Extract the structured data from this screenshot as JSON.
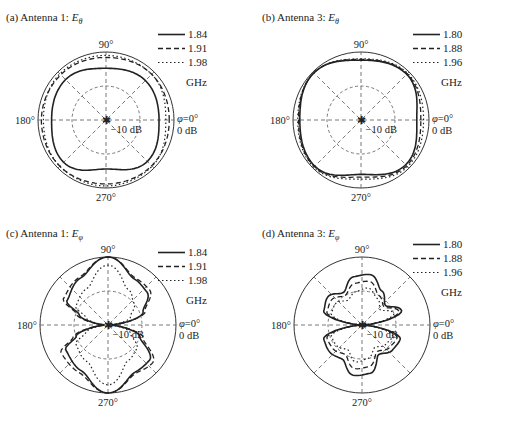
{
  "figure": {
    "panels": [
      {
        "id": "a",
        "title_prefix": "(a) Antenna 1: ",
        "title_field": "E",
        "title_sub": "θ"
      },
      {
        "id": "b",
        "title_prefix": "(b) Antenna 3: ",
        "title_field": "E",
        "title_sub": "θ"
      },
      {
        "id": "c",
        "title_prefix": "(c) Antenna 1: ",
        "title_field": "E",
        "title_sub": "φ"
      },
      {
        "id": "d",
        "title_prefix": "(d) Antenna 3: ",
        "title_field": "E",
        "title_sub": "φ"
      }
    ],
    "angle_labels": {
      "top": "90°",
      "left": "180°",
      "bottom": "270°",
      "right_phi": "φ=0°",
      "right_db": "0 dB"
    },
    "ring_label": "−10 dB",
    "unit": "GHz"
  },
  "chart_data": [
    {
      "type": "polar",
      "title": "(a) Antenna 1: Eθ",
      "radial_ticks": [
        "-10 dB",
        "0 dB"
      ],
      "angle_ticks": [
        "0°",
        "90°",
        "180°",
        "270°"
      ],
      "legend": [
        {
          "label": "1.84",
          "style": "solid"
        },
        {
          "label": "1.91",
          "style": "dashed"
        },
        {
          "label": "1.98",
          "style": "dotted"
        }
      ],
      "legend_unit": "GHz",
      "series": [
        {
          "name": "1.84",
          "angles_deg": [
            0,
            45,
            90,
            135,
            180,
            225,
            270,
            315
          ],
          "radius_norm": [
            0.78,
            0.82,
            0.76,
            0.84,
            0.8,
            0.88,
            0.72,
            0.86
          ]
        },
        {
          "name": "1.91",
          "angles_deg": [
            0,
            45,
            90,
            135,
            180,
            225,
            270,
            315
          ],
          "radius_norm": [
            0.93,
            0.95,
            0.92,
            0.94,
            0.95,
            0.96,
            0.94,
            0.95
          ]
        },
        {
          "name": "1.98",
          "angles_deg": [
            0,
            45,
            90,
            135,
            180,
            225,
            270,
            315
          ],
          "radius_norm": [
            0.88,
            0.95,
            0.95,
            0.96,
            0.92,
            0.96,
            0.97,
            0.96
          ]
        }
      ]
    },
    {
      "type": "polar",
      "title": "(b) Antenna 3: Eθ",
      "radial_ticks": [
        "-10 dB",
        "0 dB"
      ],
      "angle_ticks": [
        "0°",
        "90°",
        "180°",
        "270°"
      ],
      "legend": [
        {
          "label": "1.80",
          "style": "solid"
        },
        {
          "label": "1.88",
          "style": "dashed"
        },
        {
          "label": "1.96",
          "style": "dotted"
        }
      ],
      "legend_unit": "GHz",
      "series": [
        {
          "name": "1.80",
          "angles_deg": [
            0,
            45,
            90,
            135,
            180,
            225,
            270,
            315
          ],
          "radius_norm": [
            0.82,
            0.95,
            0.88,
            0.98,
            0.9,
            0.96,
            0.8,
            0.93
          ]
        },
        {
          "name": "1.88",
          "angles_deg": [
            0,
            45,
            90,
            135,
            180,
            225,
            270,
            315
          ],
          "radius_norm": [
            0.88,
            0.96,
            0.89,
            0.98,
            0.92,
            0.97,
            0.84,
            0.95
          ]
        },
        {
          "name": "1.96",
          "angles_deg": [
            0,
            45,
            90,
            135,
            180,
            225,
            270,
            315
          ],
          "radius_norm": [
            0.92,
            0.97,
            0.9,
            0.98,
            0.93,
            0.98,
            0.87,
            0.97
          ]
        }
      ]
    },
    {
      "type": "polar",
      "title": "(c) Antenna 1: Eφ",
      "radial_ticks": [
        "-10 dB",
        "0 dB"
      ],
      "angle_ticks": [
        "0°",
        "90°",
        "180°",
        "270°"
      ],
      "legend": [
        {
          "label": "1.84",
          "style": "solid"
        },
        {
          "label": "1.91",
          "style": "dashed"
        },
        {
          "label": "1.98",
          "style": "dotted"
        }
      ],
      "legend_unit": "GHz",
      "series": [
        {
          "name": "1.84",
          "angles_deg": [
            0,
            20,
            40,
            60,
            90,
            120,
            150,
            160,
            180,
            200,
            210,
            240,
            270,
            300,
            320,
            340
          ],
          "radius_norm": [
            0.05,
            0.55,
            0.75,
            0.78,
            1.0,
            0.8,
            0.7,
            0.45,
            0.05,
            0.5,
            0.72,
            0.78,
            1.0,
            0.8,
            0.8,
            0.5
          ]
        },
        {
          "name": "1.91",
          "angles_deg": [
            0,
            20,
            40,
            60,
            90,
            120,
            150,
            160,
            180,
            200,
            210,
            240,
            270,
            300,
            320,
            340
          ],
          "radius_norm": [
            0.05,
            0.58,
            0.8,
            0.8,
            1.0,
            0.82,
            0.76,
            0.5,
            0.05,
            0.55,
            0.8,
            0.82,
            1.0,
            0.82,
            0.86,
            0.55
          ]
        },
        {
          "name": "1.98",
          "angles_deg": [
            0,
            20,
            40,
            60,
            90,
            120,
            150,
            160,
            180,
            200,
            210,
            240,
            270,
            300,
            320,
            340
          ],
          "radius_norm": [
            0.05,
            0.35,
            0.5,
            0.6,
            0.88,
            0.62,
            0.55,
            0.35,
            0.05,
            0.35,
            0.55,
            0.62,
            0.88,
            0.6,
            0.55,
            0.35
          ]
        }
      ]
    },
    {
      "type": "polar",
      "title": "(d) Antenna 3: Eφ",
      "radial_ticks": [
        "-10 dB",
        "0 dB"
      ],
      "angle_ticks": [
        "0°",
        "90°",
        "180°",
        "270°"
      ],
      "legend": [
        {
          "label": "1.80",
          "style": "solid"
        },
        {
          "label": "1.88",
          "style": "dashed"
        },
        {
          "label": "1.96",
          "style": "dotted"
        }
      ],
      "legend_unit": "GHz",
      "series": [
        {
          "name": "1.80",
          "angles_deg": [
            0,
            20,
            40,
            60,
            80,
            100,
            120,
            140,
            160,
            180,
            200,
            220,
            240,
            260,
            280,
            300,
            320,
            340
          ],
          "radius_norm": [
            0.02,
            0.62,
            0.45,
            0.58,
            0.75,
            0.72,
            0.55,
            0.65,
            0.6,
            0.02,
            0.6,
            0.62,
            0.58,
            0.75,
            0.72,
            0.5,
            0.58,
            0.6
          ]
        },
        {
          "name": "1.88",
          "angles_deg": [
            0,
            20,
            40,
            60,
            80,
            100,
            120,
            140,
            160,
            180,
            200,
            220,
            240,
            260,
            280,
            300,
            320,
            340
          ],
          "radius_norm": [
            0.02,
            0.58,
            0.42,
            0.5,
            0.65,
            0.62,
            0.5,
            0.58,
            0.55,
            0.02,
            0.55,
            0.55,
            0.5,
            0.65,
            0.62,
            0.45,
            0.52,
            0.55
          ]
        },
        {
          "name": "1.96",
          "angles_deg": [
            0,
            20,
            40,
            60,
            80,
            100,
            120,
            140,
            160,
            180,
            200,
            220,
            240,
            260,
            280,
            300,
            320,
            340
          ],
          "radius_norm": [
            0.02,
            0.5,
            0.35,
            0.45,
            0.55,
            0.5,
            0.42,
            0.5,
            0.48,
            0.02,
            0.48,
            0.48,
            0.42,
            0.55,
            0.5,
            0.38,
            0.45,
            0.48
          ]
        }
      ]
    }
  ]
}
